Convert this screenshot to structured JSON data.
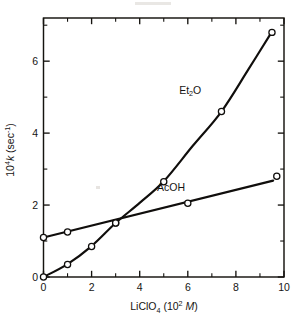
{
  "chart_data": {
    "type": "line",
    "title": "",
    "subtitle": "",
    "xlabel_parts": {
      "base": "LiClO",
      "base_sub": "4",
      "paren_open": " (10",
      "exp": "2",
      "unit": "M",
      "paren_close": ")"
    },
    "ylabel_parts": {
      "base": "10",
      "exp": "4",
      "sym": "k",
      "paren_open": " (sec",
      "exp2": "-1",
      "paren_close": ")"
    },
    "xlabel": "LiClO4 (10^2 M)",
    "ylabel": "10^4 k (sec^-1)",
    "xlim": [
      0,
      10
    ],
    "ylim": [
      0,
      7.2
    ],
    "x_ticks_major": [
      0,
      2,
      4,
      6,
      8,
      10
    ],
    "x_ticks_major_labels": [
      "0",
      "2",
      "4",
      "6",
      "8",
      "10"
    ],
    "x_ticks_minor": [
      1,
      3,
      5,
      7,
      9
    ],
    "y_ticks_major": [
      0,
      2,
      4,
      6
    ],
    "y_ticks_major_labels": [
      "0",
      "2",
      "4",
      "6"
    ],
    "y_ticks_minor": [
      1,
      3,
      5,
      7
    ],
    "grid": false,
    "legend_position": "inline-annotations",
    "marker_style": "open-circle",
    "series": [
      {
        "name": "Et2O",
        "label": "Et₂O",
        "label_base": "Et",
        "label_sub": "2",
        "label_tail": "O",
        "label_x": 6.1,
        "label_y": 5.1,
        "points": [
          {
            "x": 0.0,
            "y": 0.0
          },
          {
            "x": 1.0,
            "y": 0.35
          },
          {
            "x": 2.0,
            "y": 0.85
          },
          {
            "x": 3.0,
            "y": 1.5
          },
          {
            "x": 5.0,
            "y": 2.65
          },
          {
            "x": 7.4,
            "y": 4.6
          },
          {
            "x": 9.5,
            "y": 6.8
          }
        ],
        "curve_path": [
          {
            "x": 0.0,
            "y": 0.0
          },
          {
            "x": 1.0,
            "y": 0.36
          },
          {
            "x": 2.0,
            "y": 0.86
          },
          {
            "x": 3.0,
            "y": 1.5
          },
          {
            "x": 4.0,
            "y": 2.06
          },
          {
            "x": 5.0,
            "y": 2.66
          },
          {
            "x": 6.2,
            "y": 3.64
          },
          {
            "x": 7.4,
            "y": 4.6
          },
          {
            "x": 8.5,
            "y": 5.75
          },
          {
            "x": 9.5,
            "y": 6.82
          }
        ]
      },
      {
        "name": "AcOH",
        "label": "AcOH",
        "label_x": 5.3,
        "label_y": 2.38,
        "points": [
          {
            "x": 0.0,
            "y": 1.1
          },
          {
            "x": 1.0,
            "y": 1.25
          },
          {
            "x": 3.0,
            "y": 1.5
          },
          {
            "x": 6.0,
            "y": 2.05
          },
          {
            "x": 9.7,
            "y": 2.8
          }
        ],
        "curve_path": [
          {
            "x": 0.0,
            "y": 1.1
          },
          {
            "x": 9.55,
            "y": 2.68
          }
        ]
      }
    ],
    "intersection": {
      "x": 3.8,
      "y": 1.65
    },
    "colors": {
      "line": "#100e0c",
      "axis": "#15130f",
      "text": "#161412",
      "marker_fill": "#ffffff",
      "background": "#ffffff"
    }
  }
}
